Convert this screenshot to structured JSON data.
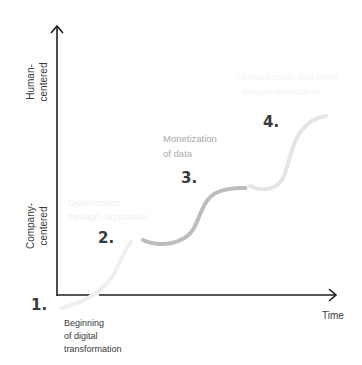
{
  "colors": {
    "axis": "#1e1e1e",
    "curve1": "#f0f0f0",
    "curve2": "#bdbdbd",
    "curve3": "#e6e6e6",
    "text_dark": "#3a3a3a",
    "text_mid": "#a8a8a8",
    "text_faint": "#f2f2f2"
  },
  "axes": {
    "y_top_label_line1": "Human-",
    "y_top_label_line2": "centered",
    "y_bottom_label_line1": "Company-",
    "y_bottom_label_line2": "centered",
    "x_label": "Time"
  },
  "stages": [
    {
      "number": "1.",
      "desc_line1": "Beginning",
      "desc_line2": "of digital",
      "desc_line3": "transformation"
    },
    {
      "number": "2.",
      "desc_line1": "Optimization",
      "desc_line2": "through digitization"
    },
    {
      "number": "3.",
      "desc_line1": "Monetization",
      "desc_line2": "of data"
    },
    {
      "number": "4.",
      "desc_line1": "Humanization and more",
      "desc_line2": "people-orientation"
    }
  ]
}
